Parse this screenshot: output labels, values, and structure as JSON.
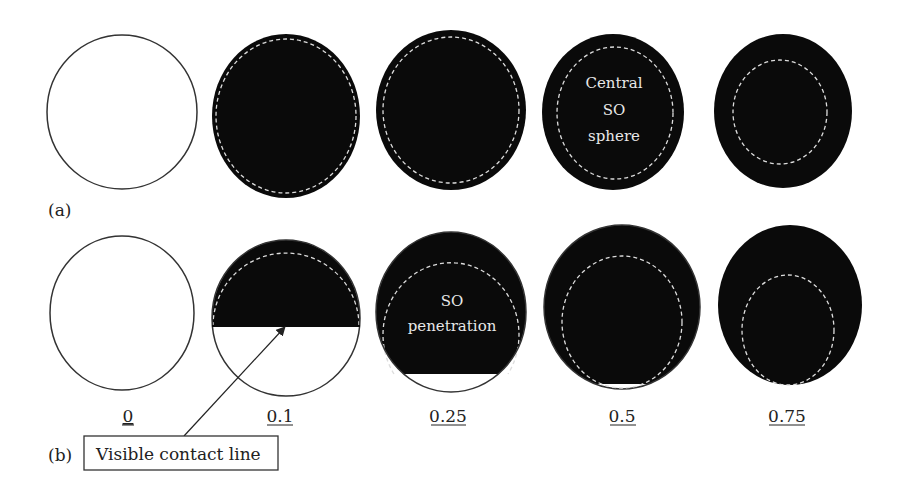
{
  "figure": {
    "panels": [
      {
        "id": "a",
        "label": "(a)",
        "description": "Central SO sphere",
        "circles": [
          {
            "value": "0",
            "filled": false
          },
          {
            "value": "0.1",
            "filled": true
          },
          {
            "value": "0.25",
            "filled": true
          },
          {
            "value": "0.5",
            "filled": true,
            "text_lines": [
              "Central",
              "SO",
              "sphere"
            ]
          },
          {
            "value": "0.75",
            "filled": true
          }
        ]
      },
      {
        "id": "b",
        "label": "(b)",
        "description": "SO penetration",
        "circles": [
          {
            "value": "0",
            "filled": false
          },
          {
            "value": "0.1",
            "filled": "partial"
          },
          {
            "value": "0.25",
            "filled": "partial",
            "text_lines": [
              "SO",
              "penetration"
            ]
          },
          {
            "value": "0.5",
            "filled": "nearly"
          },
          {
            "value": "0.75",
            "filled": true
          }
        ]
      }
    ],
    "value_labels": [
      "0",
      "0.1",
      "0.25",
      "0.5",
      "0.75"
    ],
    "callout": {
      "text": "Visible contact line"
    },
    "colors": {
      "fill": "#0a0a0a",
      "outline": "#333333",
      "dashed": "#dddddd",
      "background": "#ffffff"
    }
  }
}
